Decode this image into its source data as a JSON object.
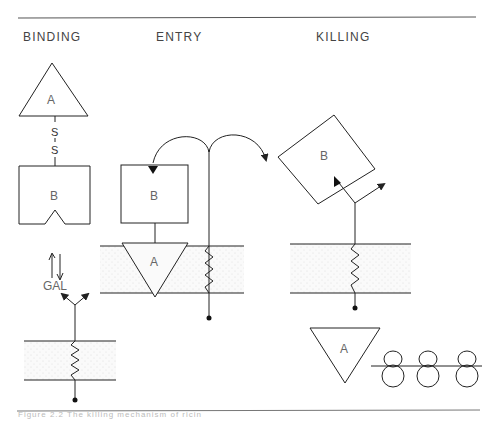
{
  "stages": {
    "binding": "BINDING",
    "entry": "ENTRY",
    "killing": "KILLING"
  },
  "molecules": {
    "chain_a": "A",
    "chain_b": "B",
    "disulfide_s1": "S",
    "disulfide_s2": "S",
    "galactose": "GAL"
  },
  "caption": "Figure 2.2  The killing mechanism of ricin",
  "colors": {
    "line": "#222222",
    "membrane_fill": "#f2f2f2",
    "text": "#555555"
  }
}
